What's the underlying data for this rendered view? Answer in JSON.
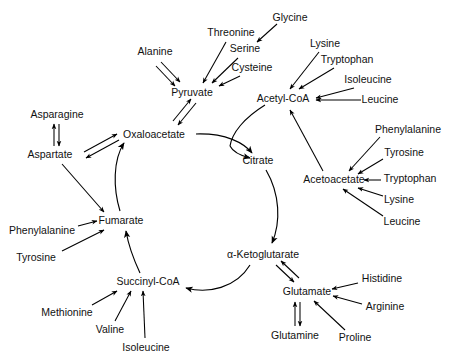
{
  "diagram": {
    "type": "metabolic-pathway",
    "background_color": "#ffffff",
    "line_color": "#000000",
    "text_color": "#111111",
    "cycle_nodes": [
      {
        "id": "pyruvate",
        "label": "Pyruvate",
        "x": 192,
        "y": 93
      },
      {
        "id": "acetyl_coa",
        "label": "Acetyl-CoA",
        "x": 283,
        "y": 99
      },
      {
        "id": "oxaloacetate",
        "label": "Oxaloacetate",
        "x": 154,
        "y": 135
      },
      {
        "id": "citrate",
        "label": "Citrate",
        "x": 258,
        "y": 161
      },
      {
        "id": "acetoacetate",
        "label": "Acetoacetate",
        "x": 334,
        "y": 180
      },
      {
        "id": "fumarate",
        "label": "Fumarate",
        "x": 121,
        "y": 221
      },
      {
        "id": "alpha_ketoglutarate",
        "label": "α-Ketoglutarate",
        "x": 263,
        "y": 255
      },
      {
        "id": "succinyl_coa",
        "label": "Succinyl-CoA",
        "x": 148,
        "y": 282
      },
      {
        "id": "glutamate",
        "label": "Glutamate",
        "x": 307,
        "y": 292
      }
    ],
    "amino_acids": [
      {
        "id": "alanine",
        "label": "Alanine",
        "x": 155,
        "y": 52,
        "anchor": "middle"
      },
      {
        "id": "threonine",
        "label": "Threonine",
        "x": 231,
        "y": 33,
        "anchor": "middle"
      },
      {
        "id": "serine",
        "label": "Serine",
        "x": 245,
        "y": 49,
        "anchor": "middle"
      },
      {
        "id": "cysteine",
        "label": "Cysteine",
        "x": 252,
        "y": 68,
        "anchor": "middle"
      },
      {
        "id": "glycine",
        "label": "Glycine",
        "x": 290,
        "y": 18,
        "anchor": "middle"
      },
      {
        "id": "lysine_acetyl",
        "label": "Lysine",
        "x": 325,
        "y": 44,
        "anchor": "middle"
      },
      {
        "id": "tryptophan_acetyl",
        "label": "Tryptophan",
        "x": 347,
        "y": 60,
        "anchor": "middle"
      },
      {
        "id": "isoleucine_acetyl",
        "label": "Isoleucine",
        "x": 368,
        "y": 80,
        "anchor": "middle"
      },
      {
        "id": "leucine_acetyl",
        "label": "Leucine",
        "x": 380,
        "y": 100,
        "anchor": "middle"
      },
      {
        "id": "phenylalanine_acac",
        "label": "Phenylalanine",
        "x": 408,
        "y": 130,
        "anchor": "middle"
      },
      {
        "id": "tyrosine_acac",
        "label": "Tyrosine",
        "x": 404,
        "y": 153,
        "anchor": "middle"
      },
      {
        "id": "tryptophan_acac",
        "label": "Tryptophan",
        "x": 410,
        "y": 179,
        "anchor": "middle"
      },
      {
        "id": "lysine_acac",
        "label": "Lysine",
        "x": 399,
        "y": 200,
        "anchor": "middle"
      },
      {
        "id": "leucine_acac",
        "label": "Leucine",
        "x": 402,
        "y": 222,
        "anchor": "middle"
      },
      {
        "id": "asparagine",
        "label": "Asparagine",
        "x": 57,
        "y": 115,
        "anchor": "middle"
      },
      {
        "id": "aspartate",
        "label": "Aspartate",
        "x": 50,
        "y": 155,
        "anchor": "middle"
      },
      {
        "id": "phenylalanine_fum",
        "label": "Phenylalanine",
        "x": 42,
        "y": 231,
        "anchor": "middle"
      },
      {
        "id": "tyrosine_fum",
        "label": "Tyrosine",
        "x": 36,
        "y": 258,
        "anchor": "middle"
      },
      {
        "id": "methionine",
        "label": "Methionine",
        "x": 67,
        "y": 313,
        "anchor": "middle"
      },
      {
        "id": "valine",
        "label": "Valine",
        "x": 110,
        "y": 330,
        "anchor": "middle"
      },
      {
        "id": "isoleucine_succ",
        "label": "Isoleucine",
        "x": 146,
        "y": 348,
        "anchor": "middle"
      },
      {
        "id": "histidine",
        "label": "Histidine",
        "x": 382,
        "y": 279,
        "anchor": "middle"
      },
      {
        "id": "arginine",
        "label": "Arginine",
        "x": 385,
        "y": 307,
        "anchor": "middle"
      },
      {
        "id": "proline",
        "label": "Proline",
        "x": 355,
        "y": 338,
        "anchor": "middle"
      },
      {
        "id": "glutamine",
        "label": "Glutamine",
        "x": 295,
        "y": 336,
        "anchor": "middle"
      }
    ],
    "edges": [
      {
        "from": "alanine",
        "to": "pyruvate",
        "style": "double"
      },
      {
        "from": "threonine",
        "to": "pyruvate",
        "style": "single"
      },
      {
        "from": "serine",
        "to": "pyruvate",
        "style": "single"
      },
      {
        "from": "cysteine",
        "to": "pyruvate",
        "style": "single"
      },
      {
        "from": "glycine",
        "to": "serine",
        "style": "single"
      },
      {
        "from": "pyruvate",
        "to": "oxaloacetate",
        "style": "double"
      },
      {
        "from": "lysine_acetyl",
        "to": "acetyl_coa",
        "style": "single"
      },
      {
        "from": "tryptophan_acetyl",
        "to": "acetyl_coa",
        "style": "single"
      },
      {
        "from": "isoleucine_acetyl",
        "to": "acetyl_coa",
        "style": "single"
      },
      {
        "from": "leucine_acetyl",
        "to": "acetyl_coa",
        "style": "single"
      },
      {
        "from": "acetoacetate",
        "to": "acetyl_coa",
        "style": "single"
      },
      {
        "from": "phenylalanine_acac",
        "to": "acetoacetate",
        "style": "single"
      },
      {
        "from": "tyrosine_acac",
        "to": "acetoacetate",
        "style": "single"
      },
      {
        "from": "tryptophan_acac",
        "to": "acetoacetate",
        "style": "single"
      },
      {
        "from": "lysine_acac",
        "to": "acetoacetate",
        "style": "single"
      },
      {
        "from": "leucine_acac",
        "to": "acetoacetate",
        "style": "single"
      },
      {
        "from": "asparagine",
        "to": "aspartate",
        "style": "double"
      },
      {
        "from": "aspartate",
        "to": "oxaloacetate",
        "style": "double"
      },
      {
        "from": "aspartate",
        "to": "fumarate",
        "style": "single"
      },
      {
        "from": "phenylalanine_fum",
        "to": "fumarate",
        "style": "single"
      },
      {
        "from": "tyrosine_fum",
        "to": "fumarate",
        "style": "single"
      },
      {
        "from": "methionine",
        "to": "succinyl_coa",
        "style": "single"
      },
      {
        "from": "valine",
        "to": "succinyl_coa",
        "style": "single"
      },
      {
        "from": "isoleucine_succ",
        "to": "succinyl_coa",
        "style": "single"
      },
      {
        "from": "histidine",
        "to": "glutamate",
        "style": "single"
      },
      {
        "from": "arginine",
        "to": "glutamate",
        "style": "single"
      },
      {
        "from": "proline",
        "to": "glutamate",
        "style": "single"
      },
      {
        "from": "glutamine",
        "to": "glutamate",
        "style": "double"
      },
      {
        "from": "alpha_ketoglutarate",
        "to": "glutamate",
        "style": "double"
      },
      {
        "from": "oxaloacetate",
        "to": "citrate",
        "style": "arc"
      },
      {
        "from": "acetyl_coa",
        "to": "citrate",
        "style": "arc"
      },
      {
        "from": "citrate",
        "to": "alpha_ketoglutarate",
        "style": "arc"
      },
      {
        "from": "alpha_ketoglutarate",
        "to": "succinyl_coa",
        "style": "arc"
      },
      {
        "from": "succinyl_coa",
        "to": "fumarate",
        "style": "arc"
      },
      {
        "from": "fumarate",
        "to": "oxaloacetate",
        "style": "arc"
      }
    ]
  }
}
